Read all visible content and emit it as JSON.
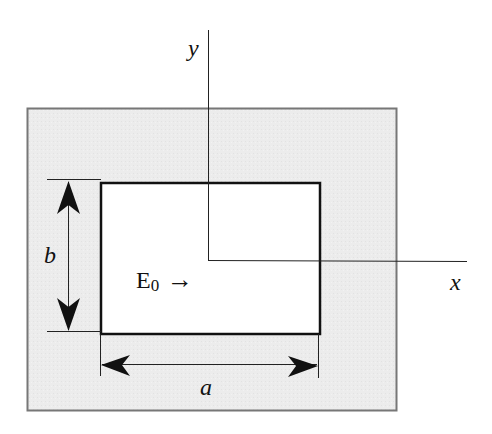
{
  "diagram": {
    "axes": {
      "x_label": "x",
      "y_label": "y"
    },
    "dimensions": {
      "width_label": "a",
      "height_label": "b"
    },
    "field": {
      "label": "E",
      "subscript": "0",
      "arrow": "→"
    },
    "colors": {
      "outer_fill": "#ececec",
      "outer_stroke": "#777777",
      "inner_fill": "#ffffff",
      "inner_stroke": "#111111",
      "line": "#222222"
    }
  }
}
